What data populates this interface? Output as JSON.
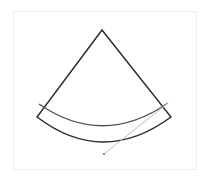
{
  "diagram": {
    "type": "sector-with-arc-and-line",
    "colors": {
      "frame": "#ececec",
      "sector_outline": "#2b2b2b",
      "inner_arc": "#555555",
      "pointer_line": "#bdbdbd",
      "pointer_dot": "#8a8a8a",
      "background": "#ffffff"
    },
    "apex": [
      102,
      30
    ],
    "sector_left_corner": [
      37,
      117
    ],
    "sector_right_corner": [
      171,
      117
    ],
    "outer_arc_bottom": [
      103,
      142
    ],
    "inner_arc": {
      "start": [
        39,
        104
      ],
      "end": [
        168,
        103
      ],
      "bottom": [
        103,
        126
      ]
    },
    "pointer_line": {
      "from": [
        168,
        103
      ],
      "to": [
        104,
        154
      ]
    },
    "pointer_dot": [
      104,
      154
    ]
  }
}
